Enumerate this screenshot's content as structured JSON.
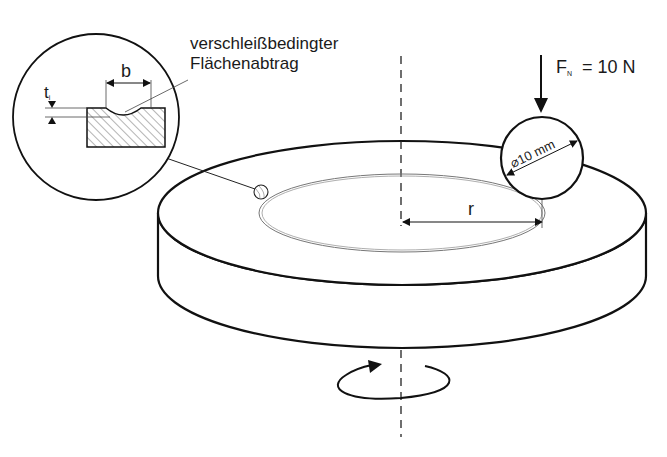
{
  "diagram": {
    "colors": {
      "stroke": "#111111",
      "thin": "#555555",
      "background": "#ffffff"
    },
    "labels": {
      "wear_line1": "verschleißbedingter",
      "wear_line2": "Flächenabtrag",
      "width_symbol": "b",
      "depth_symbol": "t",
      "depth_subscript": "i",
      "force_symbol": "F",
      "force_subscript": "N",
      "force_value": "= 10 N",
      "radius_symbol": "r",
      "ball_diameter": "⌀10 mm"
    },
    "elements": {
      "disc": {
        "cx": 402,
        "top_cy": 213,
        "rx": 244,
        "ry": 72,
        "thickness": 63
      },
      "wear_track": {
        "cx": 402,
        "cy": 213,
        "rx": 143,
        "ry": 39
      },
      "ball": {
        "cx": 542,
        "cy": 158,
        "r": 41
      },
      "detail_circle": {
        "cx": 96,
        "cy": 117,
        "r": 83
      },
      "rotation_axis_x": 401,
      "rotation_symbol": "clockwise-arrow-icon"
    }
  }
}
